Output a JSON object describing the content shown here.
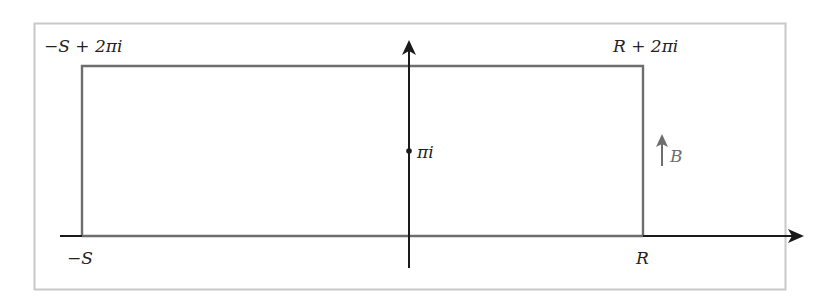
{
  "diagram": {
    "type": "contour-in-complex-plane",
    "colors": {
      "frame": "#c8c8c8",
      "axes": "#1a1a1a",
      "contour": "#6e6e6e",
      "label": "#222222",
      "label_B": "#6e6e6e"
    },
    "labels": {
      "top_left": "−S + 2πi",
      "top_right": "R + 2πi",
      "bottom_left": "−S",
      "bottom_right": "R",
      "center_point": "πi",
      "side_arrow": "B"
    },
    "contour": {
      "shape": "rectangle",
      "vertices": [
        "−S",
        "R",
        "R + 2πi",
        "−S + 2πi"
      ]
    },
    "marked_points": [
      {
        "label": "πi",
        "position": "on imaginary axis, midpoint of rectangle height"
      }
    ],
    "annotations": [
      {
        "label": "B",
        "description": "upward arrow beside right vertical edge"
      }
    ]
  }
}
